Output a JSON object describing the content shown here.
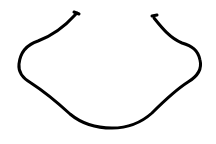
{
  "drawing": {
    "description": "single black hand-drawn curved stroke, open at the top",
    "stroke_color": "#000000",
    "background_color": "#ffffff",
    "stroke_width": 3
  }
}
